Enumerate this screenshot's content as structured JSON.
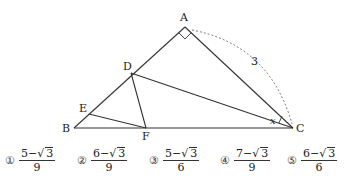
{
  "figure": {
    "points": {
      "A": {
        "label": "A",
        "x": 185,
        "y": 27
      },
      "B": {
        "label": "B",
        "x": 74,
        "y": 128
      },
      "C": {
        "label": "C",
        "x": 293,
        "y": 128
      },
      "D": {
        "label": "D",
        "x": 131,
        "y": 73
      },
      "E": {
        "label": "E",
        "x": 89,
        "y": 114
      },
      "F": {
        "label": "F",
        "x": 146,
        "y": 128
      }
    },
    "length_label": "3",
    "angle_label": "x",
    "right_angle_at": "A"
  },
  "choices": [
    {
      "marker": "①",
      "numerator": "5−",
      "radicand": "3",
      "denominator": "9"
    },
    {
      "marker": "②",
      "numerator": "6−",
      "radicand": "3",
      "denominator": "9"
    },
    {
      "marker": "③",
      "numerator": "5−",
      "radicand": "3",
      "denominator": "6"
    },
    {
      "marker": "④",
      "numerator": "7−",
      "radicand": "3",
      "denominator": "9"
    },
    {
      "marker": "⑤",
      "numerator": "6−",
      "radicand": "3",
      "denominator": "6"
    }
  ]
}
